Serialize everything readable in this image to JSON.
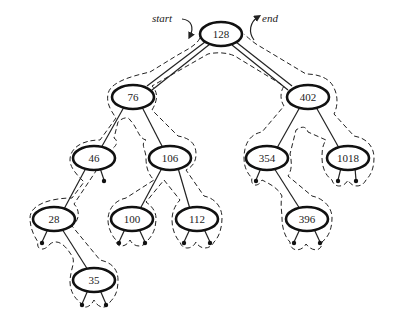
{
  "diagram": {
    "type": "binary-search-tree-euler-tour",
    "annotations": {
      "start": "start",
      "end": "end"
    },
    "nodes": [
      {
        "id": "n128",
        "label": "128",
        "x": 221,
        "y": 34
      },
      {
        "id": "n76",
        "label": "76",
        "x": 133,
        "y": 97
      },
      {
        "id": "n402",
        "label": "402",
        "x": 308,
        "y": 97
      },
      {
        "id": "n46",
        "label": "46",
        "x": 94,
        "y": 158
      },
      {
        "id": "n106",
        "label": "106",
        "x": 170,
        "y": 158
      },
      {
        "id": "n354",
        "label": "354",
        "x": 267,
        "y": 158
      },
      {
        "id": "n1018",
        "label": "1018",
        "x": 348,
        "y": 158
      },
      {
        "id": "n28",
        "label": "28",
        "x": 54,
        "y": 219
      },
      {
        "id": "n100",
        "label": "100",
        "x": 132,
        "y": 219
      },
      {
        "id": "n112",
        "label": "112",
        "x": 197,
        "y": 219
      },
      {
        "id": "n396",
        "label": "396",
        "x": 307,
        "y": 219
      },
      {
        "id": "n35",
        "label": "35",
        "x": 94,
        "y": 280
      }
    ],
    "edges": [
      [
        "n128",
        "n76"
      ],
      [
        "n128",
        "n402"
      ],
      [
        "n76",
        "n46"
      ],
      [
        "n76",
        "n106"
      ],
      [
        "n402",
        "n354"
      ],
      [
        "n402",
        "n1018"
      ],
      [
        "n46",
        "n28"
      ],
      [
        "n106",
        "n100"
      ],
      [
        "n106",
        "n112"
      ],
      [
        "n354",
        "n396"
      ],
      [
        "n28",
        "n35"
      ]
    ],
    "nil_leaves": [
      {
        "parent": "n46",
        "side": "right"
      },
      {
        "parent": "n28",
        "side": "left"
      },
      {
        "parent": "n35",
        "side": "left"
      },
      {
        "parent": "n35",
        "side": "right"
      },
      {
        "parent": "n100",
        "side": "left"
      },
      {
        "parent": "n100",
        "side": "right"
      },
      {
        "parent": "n112",
        "side": "left"
      },
      {
        "parent": "n112",
        "side": "right"
      },
      {
        "parent": "n354",
        "side": "left"
      },
      {
        "parent": "n396",
        "side": "left"
      },
      {
        "parent": "n396",
        "side": "right"
      },
      {
        "parent": "n1018",
        "side": "left"
      },
      {
        "parent": "n1018",
        "side": "right"
      }
    ]
  }
}
